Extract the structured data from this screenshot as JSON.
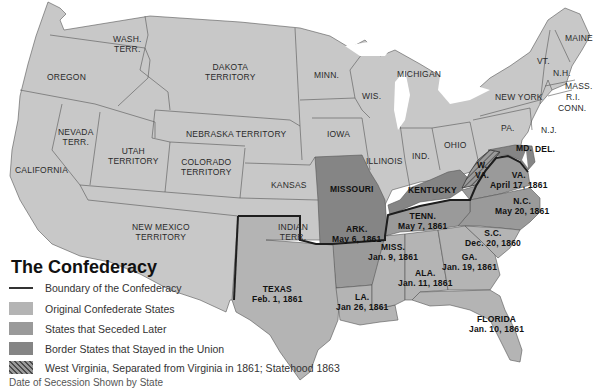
{
  "title": "The Confederacy",
  "colors": {
    "union_states": "#c8c8c8",
    "original_confederate": "#b4b4b4",
    "seceded_later": "#9a9a9a",
    "border_states": "#858585",
    "west_virginia": "hatched",
    "boundary_line": "#222222",
    "water": "#ffffff"
  },
  "legend": {
    "items": [
      {
        "symbol": "line",
        "label": "Boundary of the Confederacy"
      },
      {
        "symbol": "swatch-original",
        "label": "Original Confederate States"
      },
      {
        "symbol": "swatch-later",
        "label": "States that Seceded Later"
      },
      {
        "symbol": "swatch-border",
        "label": "Border States that Stayed in the Union"
      },
      {
        "symbol": "swatch-hatched",
        "label": "West Virginia, Separated from Virginia in 1861; Statehood 1863"
      }
    ]
  },
  "caption": "Date of Secession Shown by State",
  "regions": {
    "oregon": {
      "name": "OREGON"
    },
    "wash": {
      "name": "WASH.",
      "name2": "TERR."
    },
    "dakota": {
      "name": "DAKOTA",
      "name2": "TERRITORY"
    },
    "minn": {
      "name": "MINN."
    },
    "michigan": {
      "name": "MICHIGAN"
    },
    "wis": {
      "name": "WIS."
    },
    "maine": {
      "name": "MAINE"
    },
    "vt": {
      "name": "VT."
    },
    "nh": {
      "name": "N.H."
    },
    "mass": {
      "name": "MASS."
    },
    "ri": {
      "name": "R.I."
    },
    "conn": {
      "name": "CONN."
    },
    "newyork": {
      "name": "NEW YORK"
    },
    "pa": {
      "name": "PA."
    },
    "nj": {
      "name": "N.J."
    },
    "md": {
      "name": "MD."
    },
    "del": {
      "name": "DEL."
    },
    "nevada": {
      "name": "NEVADA",
      "name2": "TERR."
    },
    "utah": {
      "name": "UTAH",
      "name2": "TERRITORY"
    },
    "nebraska": {
      "name": "NEBRASKA TERRITORY"
    },
    "colorado": {
      "name": "COLORADO",
      "name2": "TERRITORY"
    },
    "iowa": {
      "name": "IOWA"
    },
    "illinois": {
      "name": "ILLINOIS"
    },
    "ind": {
      "name": "IND."
    },
    "ohio": {
      "name": "OHIO"
    },
    "wva": {
      "name": "W.",
      "name2": "VA."
    },
    "california": {
      "name": "CALIFORNIA"
    },
    "kansas": {
      "name": "KANSAS"
    },
    "missouri": {
      "name": "MISSOURI"
    },
    "kentucky": {
      "name": "KENTUCKY"
    },
    "newmexico": {
      "name": "NEW MEXICO",
      "name2": "TERRITORY"
    },
    "indian": {
      "name": "INDIAN",
      "name2": "TERR."
    },
    "va": {
      "name": "VA.",
      "date": "April 17, 1861"
    },
    "nc": {
      "name": "N.C.",
      "date": "May 20, 1861"
    },
    "tenn": {
      "name": "TENN.",
      "date": "May 7, 1861"
    },
    "ark": {
      "name": "ARK.",
      "date": "May 6, 1861"
    },
    "sc": {
      "name": "S.C.",
      "date": "Dec. 20, 1860"
    },
    "miss": {
      "name": "MISS.",
      "date": "Jan. 9, 1861"
    },
    "ga": {
      "name": "GA.",
      "date": "Jan. 19, 1861"
    },
    "ala": {
      "name": "ALA.",
      "date": "Jan. 11, 1861"
    },
    "texas": {
      "name": "TEXAS",
      "date": "Feb. 1, 1861"
    },
    "la": {
      "name": "LA.",
      "date": "Jan 26, 1861"
    },
    "florida": {
      "name": "FLORIDA",
      "date": "Jan. 10, 1861"
    }
  }
}
